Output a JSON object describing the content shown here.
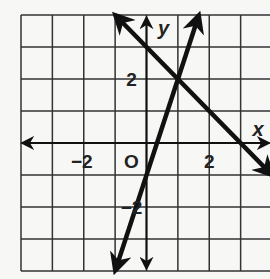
{
  "chart_data": {
    "type": "line",
    "title": "",
    "xlabel": "x",
    "ylabel": "y",
    "xlim": [
      -4,
      4
    ],
    "ylim": [
      -4,
      4
    ],
    "grid": true,
    "origin_label": "O",
    "tick_labels": {
      "x": [
        {
          "value": -2,
          "label": "−2"
        },
        {
          "value": 2,
          "label": "2"
        }
      ],
      "y": [
        {
          "value": 2,
          "label": "2"
        },
        {
          "value": -2,
          "label": "−2"
        }
      ]
    },
    "series": [
      {
        "name": "line-1",
        "equation": "y = -x + 3",
        "points": [
          [
            -1,
            4
          ],
          [
            1,
            2
          ],
          [
            3,
            0
          ],
          [
            4,
            -1
          ]
        ]
      },
      {
        "name": "line-2",
        "equation": "y = 3x - 1",
        "points": [
          [
            -1,
            -4
          ],
          [
            0,
            -1
          ],
          [
            1,
            2
          ],
          [
            1.67,
            4
          ]
        ]
      }
    ],
    "intersection": [
      1,
      2
    ],
    "color": "#111111"
  }
}
